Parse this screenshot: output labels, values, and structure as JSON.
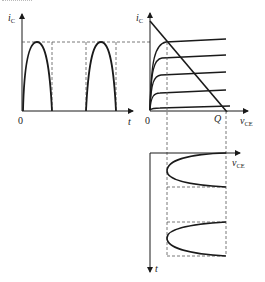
{
  "figure": {
    "left_plot": {
      "y_label": "i",
      "y_label_sub": "C",
      "x_label": "t",
      "origin_label": "0",
      "description": "half-wave rectified collector current vs time"
    },
    "right_plot": {
      "y_label": "i",
      "y_label_sub": "C",
      "x_label": "v",
      "x_label_sub": "CE",
      "origin_label": "0",
      "q_label": "Q",
      "description": "output characteristics with load line"
    },
    "bottom_plot": {
      "x_label": "v",
      "x_label_sub": "CE",
      "y_label": "t",
      "description": "collector-emitter voltage vs time (time axis downward)"
    }
  },
  "colors": {
    "stroke": "#1a1a1a",
    "dash": "#555555",
    "background": "#ffffff"
  }
}
